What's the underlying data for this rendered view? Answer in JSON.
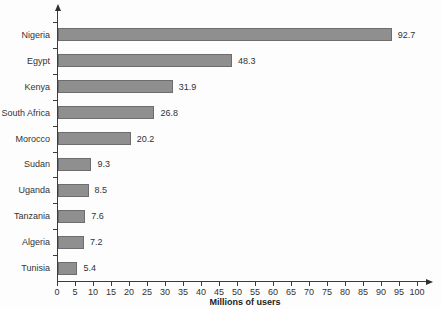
{
  "chart_data": {
    "type": "bar",
    "orientation": "horizontal",
    "categories": [
      "Nigeria",
      "Egypt",
      "Kenya",
      "South Africa",
      "Morocco",
      "Sudan",
      "Uganda",
      "Tanzania",
      "Algeria",
      "Tunisia"
    ],
    "values": [
      92.7,
      48.3,
      31.9,
      26.8,
      20.2,
      9.3,
      8.5,
      7.6,
      7.2,
      5.4
    ],
    "value_labels": [
      "92.7",
      "48.3",
      "31.9",
      "26.8",
      "20.2",
      "9.3",
      "8.5",
      "7.6",
      "7.2",
      "5.4"
    ],
    "xlabel": "Millions of users",
    "xlim": [
      0,
      100
    ],
    "xtick_step": 5,
    "grid": false,
    "bar_color": "#8f8f8f",
    "bar_border_color": "#6d6d6d",
    "axis_color": "#3c3c3c",
    "text_color": "#333333"
  }
}
